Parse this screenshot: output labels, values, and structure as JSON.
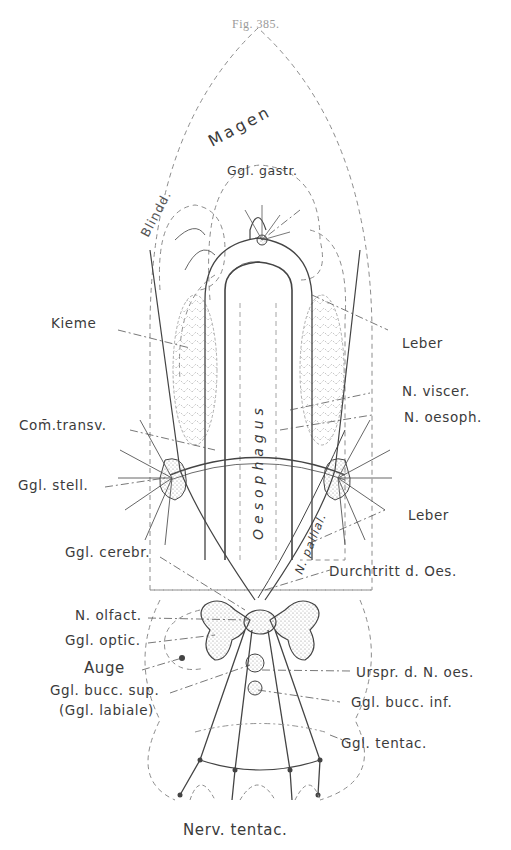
{
  "figure": {
    "caption": "Fig. 385.",
    "colors": {
      "ink": "#3b3b3b",
      "dashed": "#8c8c8c",
      "stipple": "#bdbdbd",
      "caption": "#9a9a9a"
    }
  },
  "organ_labels": {
    "magen": "Magen",
    "blinddarm": "Blindd.",
    "oesophagus": "Oesophagus",
    "n_pallial": "N. pallial."
  },
  "labels_left": [
    {
      "id": "kieme",
      "text": "Kieme"
    },
    {
      "id": "com-transv",
      "text": "Com̄.transv."
    },
    {
      "id": "ggl-stell",
      "text": "Ggl. stell."
    },
    {
      "id": "ggl-cerebr",
      "text": "Ggl. cerebr."
    },
    {
      "id": "n-olfact",
      "text": "N. olfact."
    },
    {
      "id": "ggl-optic",
      "text": "Ggl. optic."
    },
    {
      "id": "auge",
      "text": "Auge"
    },
    {
      "id": "ggl-bucc-sup",
      "text": "Ggl. bucc. sup."
    },
    {
      "id": "ggl-labiale",
      "text": "(Ggl. labiale)"
    }
  ],
  "labels_right": [
    {
      "id": "ggl-gastr",
      "text": "Ggl. gastr."
    },
    {
      "id": "leber-upper",
      "text": "Leber"
    },
    {
      "id": "n-viscer",
      "text": "N. viscer."
    },
    {
      "id": "n-oesoph",
      "text": "N. oesoph."
    },
    {
      "id": "leber-lower",
      "text": "Leber"
    },
    {
      "id": "durchtritt",
      "text": "Durchtritt d. Oes."
    },
    {
      "id": "urspr",
      "text": "Urspr. d. N. oes."
    },
    {
      "id": "ggl-bucc-inf",
      "text": "Ggl. bucc. inf."
    },
    {
      "id": "ggl-tentac",
      "text": "Ggl. tentac."
    }
  ],
  "labels_bottom": [
    {
      "id": "nerv-tentac",
      "text": "Nerv. tentac."
    }
  ]
}
